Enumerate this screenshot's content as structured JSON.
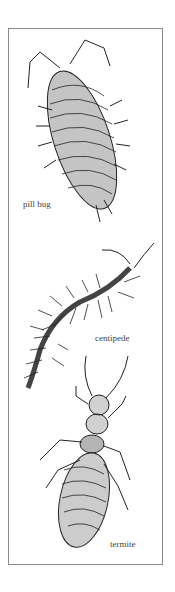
{
  "figure": {
    "panels": [
      {
        "id": "pill-bug",
        "label": "pill bug"
      },
      {
        "id": "centipede",
        "label": "centipede"
      },
      {
        "id": "termite",
        "label": "termite"
      }
    ]
  },
  "colors": {
    "frame": "#8a8a8a",
    "ink": "#222222",
    "background": "#ffffff"
  }
}
